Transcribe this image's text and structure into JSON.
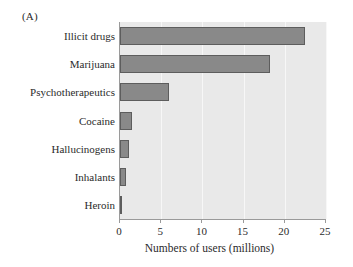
{
  "panel": {
    "label": "(A)"
  },
  "colors": {
    "bar_fill": "#898989",
    "bar_stroke": "#5d5d5d",
    "plot_background": "#e9e9e9",
    "gridline": "#f7f7f7",
    "axis": "#9a9a9a",
    "text": "#2b2b2b",
    "page_background": "#ffffff"
  },
  "chart_data": {
    "type": "bar",
    "orientation": "horizontal",
    "title": "",
    "subtitle": "",
    "xlabel": "Numbers of users (millions)",
    "ylabel": "",
    "categories": [
      "Illicit drugs",
      "Marijuana",
      "Psychotherapeutics",
      "Cocaine",
      "Hallucinogens",
      "Inhalants",
      "Heroin"
    ],
    "values": [
      22.5,
      18.2,
      6.0,
      1.4,
      1.1,
      0.7,
      0.3
    ],
    "xlim": [
      0,
      25
    ],
    "xticks": [
      0,
      5,
      10,
      15,
      20,
      25
    ],
    "xtick_labels": [
      "0",
      "5",
      "10",
      "15",
      "20",
      "25"
    ],
    "grid": true,
    "grid_axis": "x",
    "legend": false,
    "legend_position": "none",
    "annotations": []
  }
}
